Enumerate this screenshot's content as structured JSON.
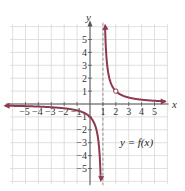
{
  "chart_data": {
    "type": "line",
    "title": "",
    "xlabel": "x",
    "ylabel": "y",
    "xlim": [
      -6,
      6
    ],
    "ylim": [
      -6,
      6
    ],
    "grid": true,
    "x_ticks": [
      -5,
      -4,
      -3,
      -2,
      -1,
      1,
      2,
      3,
      4,
      5
    ],
    "y_ticks": [
      -5,
      -4,
      -3,
      -2,
      -1,
      1,
      2,
      3,
      4,
      5
    ],
    "x_tick_labels": [
      "−5",
      "−4",
      "−3",
      "−2",
      "−1",
      "1",
      "2",
      "3",
      "4",
      "5"
    ],
    "y_tick_labels": [
      "−5",
      "−4",
      "−3",
      "−2",
      "−1",
      "1",
      "2",
      "3",
      "4",
      "5"
    ],
    "function_label": "y = f(x)",
    "vertical_asymptote": 1,
    "horizontal_asymptote": 0,
    "open_circle": {
      "x": 2,
      "y": 1
    },
    "series": [
      {
        "name": "y = f(x), left branch",
        "x": [
          -6,
          -5,
          -4,
          -3,
          -2,
          -1,
          0,
          0.5,
          0.8,
          0.85
        ],
        "y": [
          -0.14,
          -0.17,
          -0.2,
          -0.25,
          -0.33,
          -0.5,
          -1,
          -2,
          -5,
          -6.5
        ]
      },
      {
        "name": "y = f(x), right branch",
        "x": [
          1.17,
          1.2,
          1.5,
          2,
          3,
          4,
          5,
          6
        ],
        "y": [
          6,
          5,
          2,
          1,
          0.5,
          0.33,
          0.25,
          0.2
        ]
      }
    ]
  },
  "colors": {
    "curve": "#8e3a4e",
    "grid": "#d8d8d8",
    "axis": "#555555",
    "asymptote": "#777777"
  }
}
